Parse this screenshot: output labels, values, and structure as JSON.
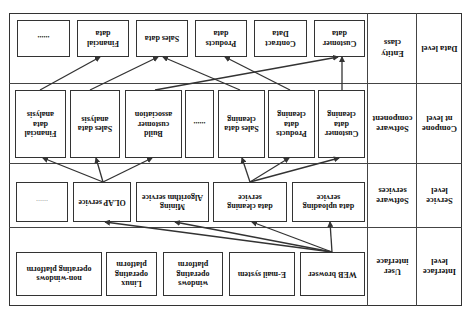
{
  "levels": [
    {
      "name": "Data level",
      "class": "Entity\nclass"
    },
    {
      "name": "Compone\nnt level",
      "class": "Software\ncomponent"
    },
    {
      "name": "Service\nlevel",
      "class": "Software\nservices"
    },
    {
      "name": "Interface\nlevel",
      "class": "User\ninterface"
    }
  ],
  "data_row": [
    "Customer\ndata",
    "Contract\nData",
    "Products\ndata",
    "Sales data",
    "Financial\ndata",
    "......"
  ],
  "component_row": [
    "Customer\ndata\ncleaning",
    "Products\ndata\ncleaning",
    "Sales data\ncleaning",
    "......",
    "Build\ncustomer\nassociation",
    "Sales data\nanalysis",
    "Financial\ndata\nanalysis"
  ],
  "service_row": [
    "data uploading\nservice",
    "data cleaning\nservice",
    "Mining\nAlgorithm service",
    "OLAP service",
    "......"
  ],
  "interface_row": [
    "WEB browser",
    "E-mail system",
    "windows\noperating\nplatform",
    "Linux\noperating\nplatform",
    "non-windows\noperating platform"
  ],
  "colors": {
    "line": "#333333",
    "background": "#ffffff"
  }
}
